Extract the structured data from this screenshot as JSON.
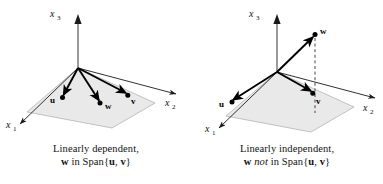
{
  "figure": {
    "background_color": "#ffffff",
    "plane_fill_color": "#e8e8e8",
    "plane_edge_color": "#b0b0b0",
    "vector_color": "#000000",
    "axis_color": "#1a1a1a",
    "vertical_axis_color": "#9a9a9a",
    "dashed_line_color": "#333333"
  },
  "panels": [
    {
      "id": "linearly-dependent",
      "axes": [
        {
          "name": "x3",
          "base": "x",
          "sub": "3",
          "label_x": 50,
          "label_y": 17
        },
        {
          "name": "x2",
          "base": "x",
          "sub": "2",
          "label_x": 165,
          "label_y": 106
        },
        {
          "name": "x1",
          "base": "x",
          "sub": "1",
          "label_x": 6,
          "label_y": 128
        }
      ],
      "vectors": [
        {
          "name": "u",
          "label": "u",
          "tip_x": 63,
          "tip_y": 97,
          "label_x": 50,
          "label_y": 103
        },
        {
          "name": "w",
          "label": "w",
          "tip_x": 100,
          "tip_y": 103,
          "label_x": 105,
          "label_y": 109
        },
        {
          "name": "v",
          "label": "v",
          "tip_x": 128,
          "tip_y": 95,
          "label_x": 131,
          "label_y": 104
        }
      ],
      "origin": {
        "x": 78,
        "y": 68
      },
      "has_dashed_drop_line": false,
      "caption": {
        "line1": "Linearly dependent,",
        "line2_pre": "w",
        "line2_mid": " in Span{",
        "line2_u": "u",
        "line2_comma": ", ",
        "line2_v": "v",
        "line2_end": "}"
      }
    },
    {
      "id": "linearly-independent",
      "axes": [
        {
          "name": "x3",
          "base": "x",
          "sub": "3",
          "label_x": 29,
          "label_y": 17
        },
        {
          "name": "x2",
          "base": "x",
          "sub": "2",
          "label_x": 172,
          "label_y": 111
        },
        {
          "name": "x1",
          "base": "x",
          "sub": "1",
          "label_x": 14,
          "label_y": 131
        }
      ],
      "vectors": [
        {
          "name": "u",
          "label": "u",
          "tip_x": 41,
          "tip_y": 102,
          "label_x": 29,
          "label_y": 106
        },
        {
          "name": "w",
          "label": "w",
          "tip_x": 124,
          "tip_y": 34,
          "label_x": 129,
          "label_y": 33
        },
        {
          "name": "v",
          "label": "v",
          "tip_x": 122,
          "tip_y": 93,
          "label_x": 125,
          "label_y": 103
        }
      ],
      "origin": {
        "x": 86,
        "y": 72
      },
      "has_dashed_drop_line": true,
      "dashed_line": {
        "x": 124,
        "y_top": 38,
        "y_bottom": 113
      },
      "caption": {
        "line1": "Linearly independent,",
        "line2_pre": "w",
        "line2_not": " not",
        "line2_mid": " in Span{",
        "line2_u": "u",
        "line2_comma": ", ",
        "line2_v": "v",
        "line2_end": "}"
      }
    }
  ]
}
